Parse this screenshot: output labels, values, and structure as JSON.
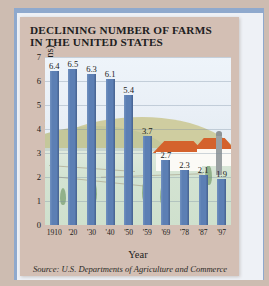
{
  "title": {
    "line1": "DECLINING NUMBER OF FARMS",
    "line2": "IN THE UNITED STATES"
  },
  "source": "Source: U.S. Departments of Agriculture and Commerce",
  "colors": {
    "bar": "#5c7fb4",
    "card": "#d3bfb4",
    "frame": "#8fa9cd",
    "plot_bg": "#eef3f8",
    "roof": "#d4622c"
  },
  "chart_data": {
    "type": "bar",
    "title": "DECLINING NUMBER OF FARMS IN THE UNITED STATES",
    "xlabel": "Year",
    "ylabel": "Number of farms (in millions)",
    "categories": [
      "1910",
      "'20",
      "'30",
      "'40",
      "'50",
      "'59",
      "'69",
      "'78",
      "'87",
      "'97"
    ],
    "values": [
      6.4,
      6.5,
      6.3,
      6.1,
      5.4,
      3.7,
      2.7,
      2.3,
      2.1,
      1.9
    ],
    "value_labels": [
      "6.4",
      "6.5",
      "6.3",
      "6.1",
      "5.4",
      "3.7",
      "2.7",
      "2.3",
      "2.1",
      "1.9"
    ],
    "yticks": [
      "0",
      "1",
      "2",
      "3",
      "4",
      "5",
      "6",
      "7"
    ],
    "ylim": [
      0,
      7
    ],
    "grid": true,
    "legend": "none",
    "series": [
      {
        "name": "Number of farms (in millions)",
        "values": [
          6.4,
          6.5,
          6.3,
          6.1,
          5.4,
          3.7,
          2.7,
          2.3,
          2.1,
          1.9
        ]
      }
    ],
    "annotation": "Background illustration of a farm landscape with farmhouses, silo, trees and hills"
  }
}
